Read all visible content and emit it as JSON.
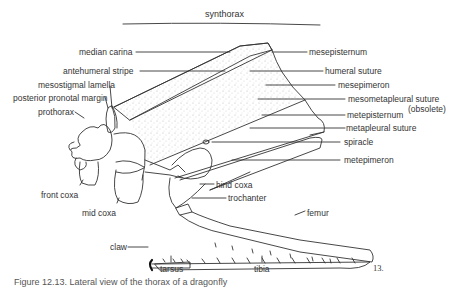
{
  "figure": {
    "title": "synthorax",
    "number": "13.",
    "caption": "Figure 12.13. Lateral view of the thorax of a dragonfly"
  },
  "labels_left": [
    {
      "id": "median-carina",
      "text": "median carina"
    },
    {
      "id": "antehumeral-stripe",
      "text": "antehumeral stripe"
    },
    {
      "id": "mesostigmal-lamella",
      "text": "mesostigmal lamella"
    },
    {
      "id": "posterior-pronotal-margin",
      "text": "posterior pronotal margin"
    },
    {
      "id": "prothorax",
      "text": "prothorax"
    },
    {
      "id": "front-coxa",
      "text": "front coxa"
    },
    {
      "id": "mid-coxa",
      "text": "mid coxa"
    },
    {
      "id": "claw",
      "text": "claw"
    },
    {
      "id": "tarsus",
      "text": "tarsus"
    }
  ],
  "labels_right": [
    {
      "id": "mesepisternum",
      "text": "mesepisternum"
    },
    {
      "id": "humeral-suture",
      "text": "humeral suture"
    },
    {
      "id": "mesepimeron",
      "text": "mesepimeron"
    },
    {
      "id": "mesometapleural-suture",
      "text": "mesometapleural suture"
    },
    {
      "id": "obsolete-note",
      "text": "(obsolete)"
    },
    {
      "id": "metepisternum",
      "text": "metepisternum"
    },
    {
      "id": "metapleural-suture",
      "text": "metapleural suture"
    },
    {
      "id": "spiracle",
      "text": "spiracle"
    },
    {
      "id": "metepimeron",
      "text": "metepimeron"
    },
    {
      "id": "hind-coxa",
      "text": "hind coxa"
    },
    {
      "id": "trochanter",
      "text": "trochanter"
    },
    {
      "id": "femur",
      "text": "femur"
    },
    {
      "id": "tibia",
      "text": "tibia"
    }
  ]
}
